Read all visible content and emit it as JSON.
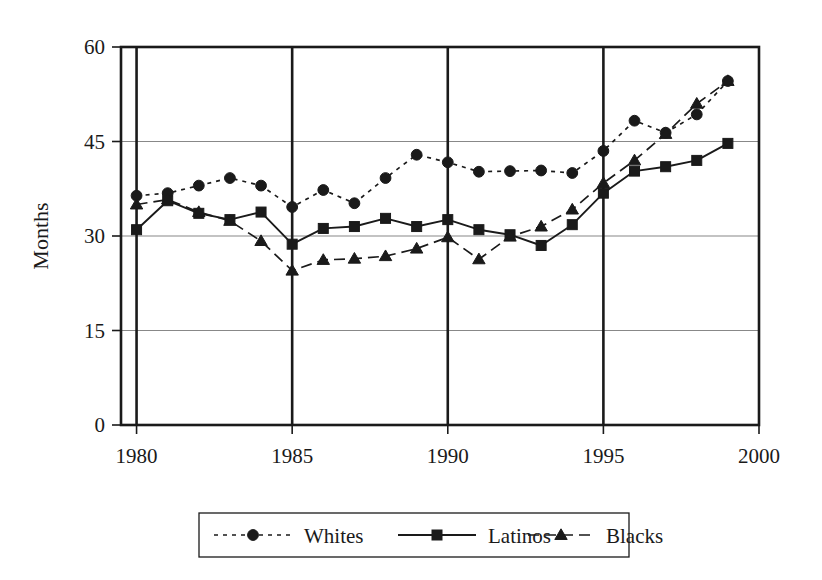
{
  "chart_data": {
    "type": "line",
    "title": "",
    "xlabel": "",
    "ylabel": "Months",
    "xlim": [
      1979.5,
      2000
    ],
    "ylim": [
      0,
      60
    ],
    "grid": true,
    "legend_position": "bottom",
    "x": [
      1980,
      1981,
      1982,
      1983,
      1984,
      1985,
      1986,
      1987,
      1988,
      1989,
      1990,
      1991,
      1992,
      1993,
      1994,
      1995,
      1996,
      1997,
      1998,
      1999
    ],
    "xticks": [
      1980,
      1985,
      1990,
      1995,
      2000
    ],
    "xtick_labels": [
      "1980",
      "1985",
      "1990",
      "1995",
      "2000"
    ],
    "yticks": [
      0,
      15,
      30,
      45,
      60
    ],
    "ytick_labels": [
      "0",
      "15",
      "30",
      "45",
      "60"
    ],
    "series": [
      {
        "name": "Whites",
        "marker": "circle",
        "linestyle": "dotted",
        "values": [
          36.4,
          36.8,
          38.0,
          39.2,
          38.0,
          34.6,
          37.3,
          35.2,
          39.2,
          42.9,
          41.7,
          40.2,
          40.3,
          40.4,
          40.0,
          43.5,
          48.3,
          46.4,
          49.3,
          54.6
        ]
      },
      {
        "name": "Latinos",
        "marker": "square",
        "linestyle": "solid",
        "values": [
          31.0,
          35.6,
          33.6,
          32.6,
          33.8,
          28.7,
          31.2,
          31.5,
          32.8,
          31.5,
          32.6,
          31.0,
          30.2,
          28.5,
          31.8,
          36.8,
          40.3,
          41.0,
          42.0,
          44.7
        ]
      },
      {
        "name": "Blacks",
        "marker": "triangle",
        "linestyle": "dashed",
        "values": [
          35.0,
          35.8,
          33.8,
          32.4,
          29.2,
          24.5,
          26.2,
          26.4,
          26.8,
          28.0,
          29.8,
          26.3,
          29.9,
          31.5,
          34.2,
          38.4,
          42.0,
          46.2,
          51.0,
          54.6
        ]
      }
    ]
  },
  "legend": {
    "items": [
      {
        "label": "Whites"
      },
      {
        "label": "Latinos"
      },
      {
        "label": "Blacks"
      }
    ]
  },
  "axes": {
    "y_title": "Months"
  }
}
